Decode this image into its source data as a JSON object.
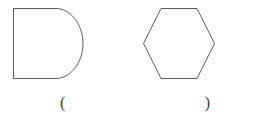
{
  "canvas": {
    "width": 270,
    "height": 120,
    "background_color": "#ffffff",
    "stroke_color": "#5a5a5a",
    "stroke_width": 1
  },
  "figures": [
    {
      "id": "figure-d-shape",
      "name": "d-shape",
      "description": "D shape: rectangle with semicircular right side",
      "bounds": {
        "x": 13,
        "y": 8,
        "width": 70,
        "height": 71
      },
      "straight_edge_end_x": 56,
      "curve_apex_x": 83,
      "center_y": 43.5
    },
    {
      "id": "figure-hexagon",
      "name": "hexagon",
      "description": "Regular hexagon, flat top and bottom edges, left and right vertices",
      "bounds": {
        "x": 143,
        "y": 8,
        "width": 72,
        "height": 72
      },
      "vertices": [
        {
          "x": 161,
          "y": 8
        },
        {
          "x": 197,
          "y": 8
        },
        {
          "x": 215,
          "y": 44
        },
        {
          "x": 197,
          "y": 79
        },
        {
          "x": 161,
          "y": 79
        },
        {
          "x": 143,
          "y": 44
        }
      ]
    }
  ],
  "answer": {
    "open_paren": "(",
    "close_paren": ")",
    "value": "",
    "placeholder": ""
  }
}
